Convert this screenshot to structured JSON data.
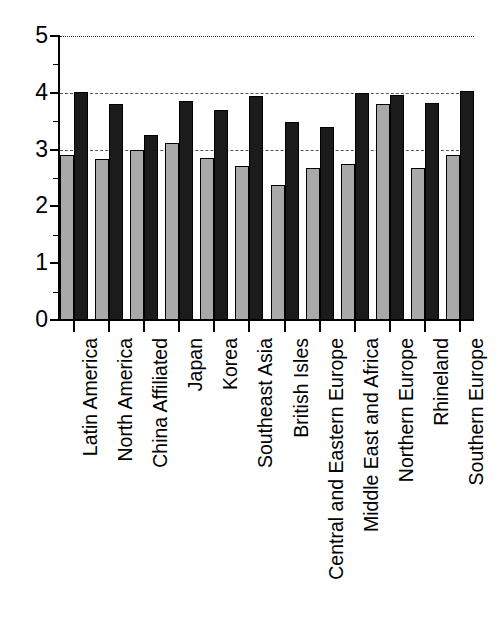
{
  "chart_data": {
    "type": "bar",
    "title": "",
    "subtitle": "",
    "xlabel": "",
    "ylabel": "",
    "ylim": [
      0,
      5
    ],
    "yticks": [
      0,
      1,
      2,
      3,
      4,
      5
    ],
    "ytick_labels": [
      "0",
      "1",
      "2",
      "3",
      "4",
      "5"
    ],
    "grid": true,
    "gridlines": [
      {
        "value": 3,
        "style": "dashed",
        "color": "#555555"
      },
      {
        "value": 4,
        "style": "dashed",
        "color": "#555555"
      },
      {
        "value": 5,
        "style": "dotted",
        "color": "#333333"
      }
    ],
    "legend": null,
    "legend_position": "none",
    "categories": [
      "Latin America",
      "North America",
      "China Affiliated",
      "Japan",
      "Korea",
      "Southeast Asia",
      "British Isles",
      "Central and Eastern Europe",
      "Middle East and Africa",
      "Northern Europe",
      "Rhineland",
      "Southern Europe"
    ],
    "series": [
      {
        "name": "series-1",
        "color": "#a9a9a9",
        "values": [
          2.9,
          2.84,
          3.0,
          3.11,
          2.86,
          2.72,
          2.37,
          2.68,
          2.75,
          3.8,
          2.68,
          2.91
        ]
      },
      {
        "name": "series-2",
        "color": "#1b1b1b",
        "values": [
          4.01,
          3.8,
          3.25,
          3.85,
          3.7,
          3.95,
          3.49,
          3.39,
          4.0,
          3.97,
          3.82,
          4.03
        ]
      }
    ]
  },
  "axes": {
    "y_axis_name": "value-axis",
    "x_axis_name": "category-axis"
  }
}
